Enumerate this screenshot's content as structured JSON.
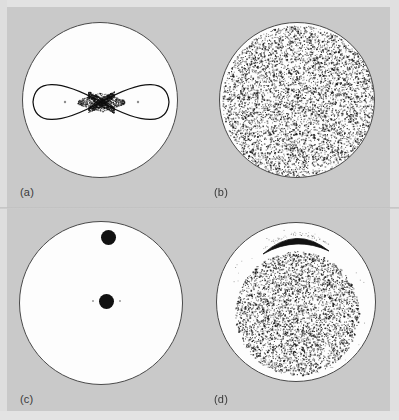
{
  "figure": {
    "background_color": "#c9c9c9",
    "disc_fill": "#fdfdfd",
    "disc_stroke": "#4a4a4a",
    "ink_color": "#111111",
    "columns": 2,
    "rows": 2
  },
  "panels": [
    {
      "id": "a",
      "label": "(a)",
      "kind": "separatrix",
      "circle": {
        "cx": 100,
        "cy": 100,
        "r": 78
      },
      "description": "figure-eight separatrix with hyperbolic X-point at center",
      "lobes": [
        {
          "center_x": 64,
          "center_y": 101,
          "rx": 32,
          "ry": 24
        },
        {
          "center_x": 136,
          "center_y": 101,
          "rx": 32,
          "ry": 24
        }
      ],
      "x_point": {
        "x": 100,
        "y": 101
      },
      "elliptic_points": [
        {
          "x": 64,
          "y": 101
        },
        {
          "x": 137,
          "y": 101
        }
      ],
      "stochastic_layer_width": 9
    },
    {
      "id": "b",
      "label": "(b)",
      "kind": "scatter",
      "circle": {
        "cx": 297,
        "cy": 100,
        "r": 78
      },
      "description": "fully ergodic chaotic orbit filling the whole disc",
      "n_points": 5200,
      "fill_fraction": 1.0,
      "point_size": 1.0,
      "inner_void_r": 0
    },
    {
      "id": "c",
      "label": "(c)",
      "kind": "islands",
      "circle": {
        "cx": 101,
        "cy": 303,
        "r": 82
      },
      "description": "two solid black islands, one off-centre above, one at centre",
      "blobs": [
        {
          "x": 107,
          "y": 236,
          "r": 7.5
        },
        {
          "x": 105,
          "y": 300,
          "r": 7.5
        }
      ],
      "satellite_dots": [
        {
          "x": 92,
          "y": 300,
          "r": 1.3
        },
        {
          "x": 119,
          "y": 300,
          "r": 1.3
        }
      ]
    },
    {
      "id": "d",
      "label": "(d)",
      "kind": "scatter-with-island",
      "circle": {
        "cx": 296,
        "cy": 302,
        "r": 80
      },
      "description": "chaotic sea confined to inner disc with a crescent island near the top",
      "n_points": 3600,
      "fill_fraction": 0.78,
      "point_size": 1.0,
      "sea_center_x": 296,
      "sea_center_y": 312,
      "sea_r": 62,
      "crescent": {
        "x_start": 262,
        "y_start": 253,
        "x_end": 328,
        "y_end": 250,
        "arc_height": 14,
        "thickness": 5
      },
      "faint_edge_dots": 40
    }
  ],
  "labels": [
    {
      "text": "(a)",
      "x": 20,
      "y": 186
    },
    {
      "text": "(b)",
      "x": 214,
      "y": 186
    },
    {
      "text": "(c)",
      "x": 20,
      "y": 393
    },
    {
      "text": "(d)",
      "x": 214,
      "y": 393
    }
  ]
}
